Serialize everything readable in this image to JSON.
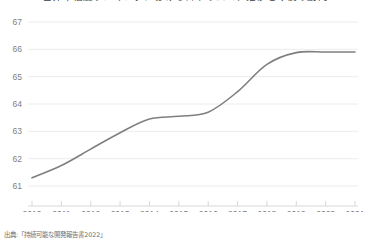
{
  "figure": {
    "title": "世界幸福度ランキングにおける日本のスコア推移と今後の動向",
    "source_note": "出典:「持続可能な開発報告書2022」",
    "background_color": "#ffffff"
  },
  "chart_data": {
    "type": "line",
    "title": "世界幸福度ランキングにおける日本のスコア推移と今後の動向",
    "xlabel": "",
    "ylabel": "",
    "x": [
      2010,
      2011,
      2012,
      2013,
      2014,
      2015,
      2016,
      2017,
      2018,
      2019,
      2020,
      2021
    ],
    "categories": [
      "2010",
      "2011",
      "2012",
      "2013",
      "2014",
      "2015",
      "2016",
      "2017",
      "2018",
      "2019",
      "2020",
      "2021"
    ],
    "series": [
      {
        "name": "スコア",
        "color": "#7f7f7f",
        "values": [
          61.3,
          61.75,
          62.35,
          62.95,
          63.45,
          63.55,
          63.7,
          64.45,
          65.45,
          65.88,
          65.9,
          65.9
        ]
      }
    ],
    "values": [
      61.3,
      61.75,
      62.35,
      62.95,
      63.45,
      63.55,
      63.7,
      64.45,
      65.45,
      65.88,
      65.9,
      65.9
    ],
    "xlim": [
      2010,
      2021
    ],
    "ylim": [
      61,
      67
    ],
    "yticks": [
      61,
      62,
      63,
      64,
      65,
      66,
      67
    ],
    "ytick_labels": [
      "61",
      "62",
      "63",
      "64",
      "65",
      "66",
      "67"
    ],
    "xticks": [
      2010,
      2011,
      2012,
      2013,
      2014,
      2015,
      2016,
      2017,
      2018,
      2019,
      2020,
      2021
    ],
    "xtick_labels": [
      "2010",
      "2011",
      "2012",
      "2013",
      "2014",
      "2015",
      "2016",
      "2017",
      "2018",
      "2019",
      "2020",
      "2021"
    ],
    "grid": true,
    "grid_axis": "y",
    "grid_color": "#ececec",
    "legend": false,
    "legend_position": "none",
    "markers": false,
    "line_width": 1.6,
    "smooth": true
  }
}
